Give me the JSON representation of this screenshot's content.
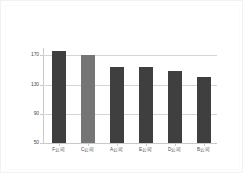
{
  "chart_data": {
    "type": "bar",
    "title": "",
    "subtitle": "",
    "xlabel": "",
    "ylabel": "",
    "categories": [
      "F公司",
      "C公司",
      "A公司",
      "E公司",
      "D公司",
      "B公司"
    ],
    "values": [
      176,
      170,
      154,
      154,
      148,
      141
    ],
    "ylim": [
      50,
      180
    ],
    "yticks": [
      50,
      90,
      130,
      170
    ],
    "ytick_labels": [
      "50",
      "90",
      "130",
      "170"
    ],
    "grid": "horizontal",
    "legend": "none",
    "bar_colors": [
      "#3f3f3f",
      "#757575",
      "#3f3f3f",
      "#3f3f3f",
      "#3f3f3f",
      "#3f3f3f"
    ],
    "highlight_index": 1,
    "series": [
      {
        "name": "",
        "values": [
          176,
          170,
          154,
          154,
          148,
          141
        ]
      }
    ]
  },
  "figure": {
    "background": "#ffffff",
    "border_color": "#f2f2f2",
    "gridline_color": "#d5d5d5",
    "axis_color": "#c9c9c9",
    "tick_label_color": "#4a4a4a"
  }
}
